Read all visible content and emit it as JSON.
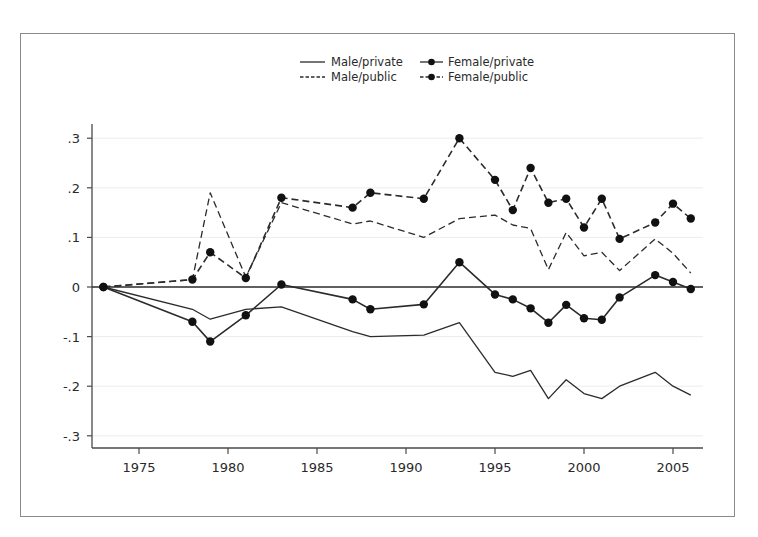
{
  "chart_data": {
    "type": "line",
    "title": "",
    "xlabel": "",
    "ylabel": "",
    "xlim": [
      1973,
      2006
    ],
    "ylim": [
      -0.3,
      0.3
    ],
    "grid": true,
    "legend_position": "top-right",
    "x_ticks": [
      1975,
      1980,
      1985,
      1990,
      1995,
      2000,
      2005
    ],
    "x_tick_labels": [
      "1975",
      "1980",
      "1985",
      "1990",
      "1995",
      "2000",
      "2005"
    ],
    "y_ticks": [
      0.3,
      0.2,
      0.1,
      0,
      -0.1,
      -0.2,
      -0.3
    ],
    "y_tick_labels": [
      ".3",
      ".2",
      ".1",
      "0",
      "-.1",
      "-.2",
      "-.3"
    ],
    "x": [
      1973,
      1978,
      1979,
      1981,
      1983,
      1987,
      1988,
      1991,
      1993,
      1995,
      1996,
      1997,
      1998,
      1999,
      2000,
      2001,
      2002,
      2004,
      2005,
      2006
    ],
    "series": [
      {
        "name": "Male/private",
        "style": "solid",
        "markers": false,
        "values": [
          0,
          -0.045,
          -0.065,
          -0.045,
          -0.04,
          -0.09,
          -0.1,
          -0.097,
          -0.072,
          -0.172,
          -0.18,
          -0.168,
          -0.225,
          -0.187,
          -0.215,
          -0.225,
          -0.2,
          -0.172,
          -0.2,
          -0.218
        ]
      },
      {
        "name": "Female/private",
        "style": "solid",
        "markers": true,
        "values": [
          0,
          -0.07,
          -0.11,
          -0.057,
          0.005,
          -0.025,
          -0.045,
          -0.035,
          0.05,
          -0.015,
          -0.025,
          -0.043,
          -0.072,
          -0.036,
          -0.063,
          -0.066,
          -0.021,
          0.024,
          0.01,
          -0.004
        ]
      },
      {
        "name": "Male/public",
        "style": "dashed",
        "markers": false,
        "values": [
          0,
          0.015,
          0.19,
          0.02,
          0.17,
          0.127,
          0.133,
          0.1,
          0.138,
          0.145,
          0.125,
          0.118,
          0.035,
          0.11,
          0.063,
          0.07,
          0.033,
          0.097,
          0.068,
          0.028
        ]
      },
      {
        "name": "Female/public",
        "style": "dashed",
        "markers": true,
        "values": [
          0,
          0.015,
          0.07,
          0.018,
          0.18,
          0.16,
          0.19,
          0.178,
          0.3,
          0.216,
          0.155,
          0.24,
          0.17,
          0.178,
          0.12,
          0.178,
          0.097,
          0.13,
          0.168,
          0.138
        ]
      }
    ],
    "reference_line": {
      "y": 0
    }
  },
  "legend": {
    "items": [
      {
        "label": "Male/private"
      },
      {
        "label": "Female/private"
      },
      {
        "label": "Male/public"
      },
      {
        "label": "Female/public"
      }
    ]
  },
  "colors": {
    "line": "#2b2b2b",
    "axis": "#4a4a4a",
    "grid": "#ececec",
    "frame": "#8a8a8a"
  }
}
